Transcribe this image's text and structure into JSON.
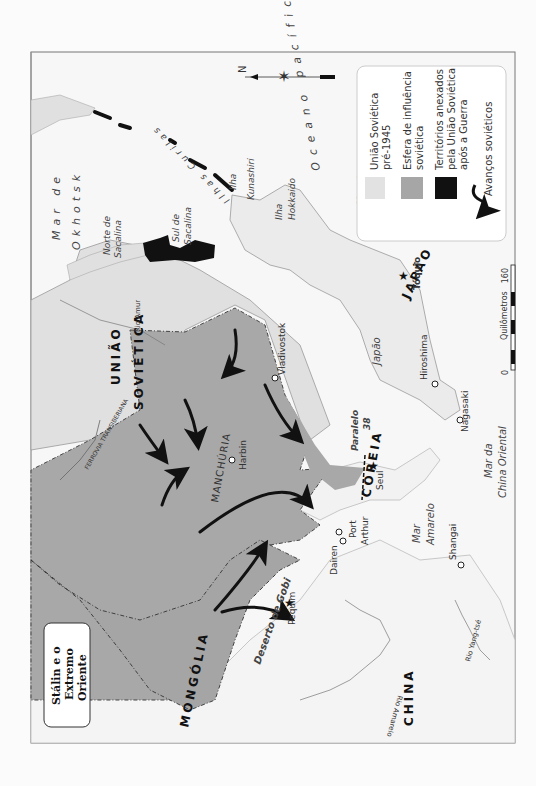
{
  "title": {
    "lines": [
      "Stálin e o",
      "Extremo",
      "Oriente"
    ]
  },
  "legend": {
    "items": [
      {
        "label_lines": [
          "União Soviética",
          "pré-1945"
        ],
        "swatch": "#e2e2e2"
      },
      {
        "label_lines": [
          "Esfera de influência",
          "soviética"
        ],
        "swatch": "#a6a6a6"
      },
      {
        "label_lines": [
          "Territórios anexados",
          "pela União Soviética",
          "após a Guerra"
        ],
        "swatch": "#111111"
      },
      {
        "label_lines": [
          "Avanços soviéticos"
        ],
        "symbol": "arrow"
      }
    ]
  },
  "scale": {
    "unit": "Quilômetros",
    "min": "0",
    "max": "160"
  },
  "compass": {
    "label": "N"
  },
  "countries": {
    "ussr": [
      "UNIÃO",
      "SOVIÉTICA"
    ],
    "mongolia": "MONGÓLIA",
    "china": "CHINA",
    "korea": "COREIA",
    "japan": "JAPÃO",
    "manchuria": "MANCHÚRIA"
  },
  "seas": {
    "okhotsk": [
      "Mar de",
      "Okhotsk"
    ],
    "pacific": "Oceano pacífico",
    "japan_sea": [
      "Mar do",
      "Japão"
    ],
    "yellow_sea": [
      "Mar",
      "Amarelo"
    ],
    "east_china_sea": [
      "Mar da",
      "China Oriental"
    ]
  },
  "regions": {
    "north_sakhalin": [
      "Norte de",
      "Sacalina"
    ],
    "south_sakhalin": [
      "Sul de",
      "Sacalina"
    ],
    "kurils": "Ilhas Curilas",
    "kunashiri": [
      "Ilha",
      "Kunashiri"
    ],
    "hokkaido": [
      "Ilha",
      "Hokkaido"
    ],
    "gobi": "Deserto de Gobi",
    "parallel": [
      "Paralelo",
      "38"
    ]
  },
  "rivers": {
    "amur": "Rio Amur",
    "yellow": "Rio Amarelo",
    "yangtze": "Rio Yang-tsé"
  },
  "railway": "FERROVIA TRANSIBERIANA",
  "cities": {
    "harbin": "Harbin",
    "vladivostok": "Vladivostok",
    "dairen": "Dairen",
    "port_arthur": [
      "Port",
      "Arthur"
    ],
    "seoul": "Seul",
    "pequim": "Pequim",
    "shanghai": "Shangai",
    "hiroshima": "Hiroshima",
    "nagasaki": "Nagasaki",
    "tokyo": "Tóquio"
  }
}
